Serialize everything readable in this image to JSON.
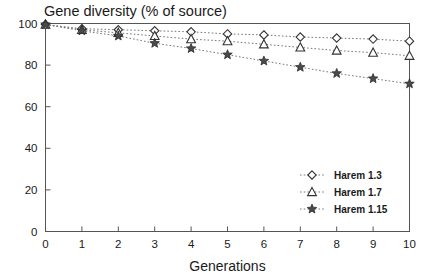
{
  "chart_data": {
    "type": "line",
    "title": "Gene diversity (% of source)",
    "xlabel": "Generations",
    "ylabel": "",
    "x": [
      0,
      1,
      2,
      3,
      4,
      5,
      6,
      7,
      8,
      9,
      10
    ],
    "xlim": [
      0,
      10
    ],
    "ylim": [
      0,
      100
    ],
    "xticks": [
      "0",
      "1",
      "2",
      "3",
      "4",
      "5",
      "6",
      "7",
      "8",
      "9",
      "10"
    ],
    "yticks": [
      "0",
      "20",
      "40",
      "60",
      "80",
      "100"
    ],
    "grid": false,
    "legend_position": "lower-right",
    "series": [
      {
        "name": "Harem 1.3",
        "marker": "diamond",
        "values": [
          99.5,
          97.5,
          97.0,
          96.5,
          96.0,
          95.0,
          94.5,
          93.5,
          93.0,
          92.5,
          91.5
        ]
      },
      {
        "name": "Harem 1.7",
        "marker": "triangle",
        "values": [
          99.5,
          97.0,
          95.5,
          94.0,
          92.5,
          91.5,
          90.0,
          88.5,
          87.0,
          86.0,
          84.5
        ]
      },
      {
        "name": "Harem 1.15",
        "marker": "star",
        "values": [
          99.5,
          96.5,
          94.0,
          90.5,
          88.0,
          85.0,
          82.0,
          79.0,
          76.0,
          73.5,
          71.0
        ]
      }
    ]
  },
  "colors": {
    "axis": "#555555",
    "line": "#777777",
    "marker_fill": "#ffffff",
    "marker_stroke": "#333333",
    "star_fill": "#4a4a4a",
    "text": "#1a1a1a",
    "background": "#ffffff"
  }
}
